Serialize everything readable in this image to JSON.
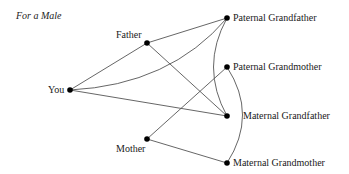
{
  "caption": "For a Male",
  "nodes": {
    "you": {
      "label": "You",
      "x": 70,
      "y": 90
    },
    "father": {
      "label": "Father",
      "x": 147,
      "y": 43
    },
    "mother": {
      "label": "Mother",
      "x": 147,
      "y": 139
    },
    "paternal_grandfather": {
      "label": "Paternal Grandfather",
      "x": 227,
      "y": 18
    },
    "paternal_grandmother": {
      "label": "Paternal Grandmother",
      "x": 227,
      "y": 67
    },
    "maternal_grandfather": {
      "label": "Maternal Grandfather",
      "x": 227,
      "y": 116
    },
    "maternal_grandmother": {
      "label": "Maternal Grandmother",
      "x": 227,
      "y": 163
    }
  },
  "edges": [
    {
      "from": "you",
      "to": "father",
      "type": "line"
    },
    {
      "from": "you",
      "to": "paternal_grandfather",
      "type": "curve"
    },
    {
      "from": "you",
      "to": "maternal_grandfather",
      "type": "line"
    },
    {
      "from": "father",
      "to": "paternal_grandfather",
      "type": "line"
    },
    {
      "from": "father",
      "to": "maternal_grandfather",
      "type": "line"
    },
    {
      "from": "mother",
      "to": "paternal_grandmother",
      "type": "line"
    },
    {
      "from": "mother",
      "to": "maternal_grandmother",
      "type": "line"
    },
    {
      "from": "paternal_grandfather",
      "to": "maternal_grandfather",
      "type": "arc-left"
    },
    {
      "from": "paternal_grandmother",
      "to": "maternal_grandmother",
      "type": "arc-right"
    }
  ],
  "colors": {
    "line": "#555555",
    "node": "#000000",
    "text": "#1a1a1a"
  }
}
